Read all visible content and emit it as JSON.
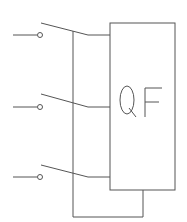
{
  "diagram": {
    "type": "circuit-schematic",
    "component": {
      "label": "QF",
      "name": "circuit-breaker"
    },
    "switches": [
      {
        "id": 1,
        "name": "switch-1"
      },
      {
        "id": 2,
        "name": "switch-2"
      },
      {
        "id": 3,
        "name": "switch-3"
      }
    ],
    "colors": {
      "line": "#555555",
      "background": "#ffffff"
    }
  }
}
